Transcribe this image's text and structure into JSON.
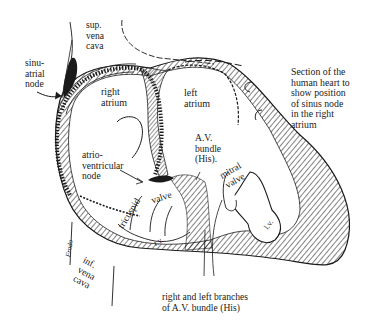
{
  "figure": {
    "caption": "Section of the\nhuman heart to\nshow position\nof sinus node\nin the right\natrium",
    "labels": {
      "sup_vena_cava": "sup.\nvena\ncava",
      "sinu_atrial_node": "sinu-\natrial\nnode",
      "right_atrium": "right\natrium",
      "left_atrium": "left\natrium",
      "av_bundle": "A.V.\nbundle\n(His).",
      "atrioventricular_node": "atrio-\nventricular\nnode",
      "tricuspid": "tricuspid",
      "valve": "valve",
      "mitral_valve": "mitral\nvalve",
      "rv": "r.v.",
      "lv": "l.v.",
      "inf_vena_cava": "inf.\nvena\ncava",
      "branches": "right and left branches\nof A.V. bundle (His)",
      "artist_signature": "Frodo"
    },
    "colors": {
      "ink": "#1a1a1a",
      "background": "#ffffff"
    }
  }
}
